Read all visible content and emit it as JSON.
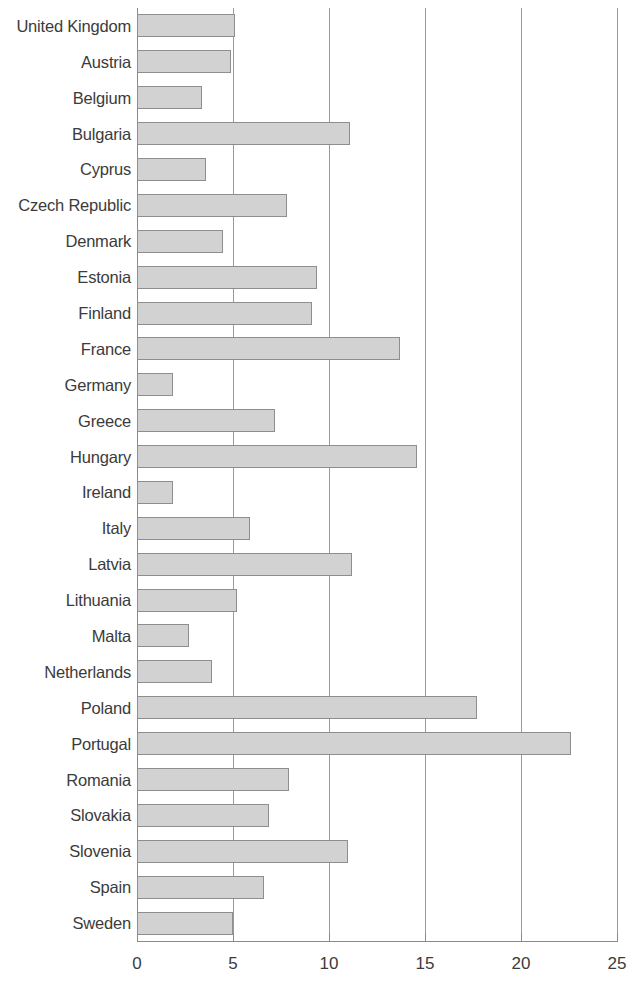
{
  "chart_data": {
    "type": "bar",
    "orientation": "horizontal",
    "title": "",
    "subtitle": "",
    "xlabel": "",
    "ylabel": "",
    "xlim": [
      0,
      25
    ],
    "ylim": null,
    "grid": true,
    "legend": null,
    "xticks": [
      0,
      5,
      10,
      15,
      20,
      25
    ],
    "xtick_labels": [
      "0",
      "5",
      "10",
      "15",
      "20",
      "25"
    ],
    "categories": [
      "United Kingdom",
      "Austria",
      "Belgium",
      "Bulgaria",
      "Cyprus",
      "Czech Republic",
      "Denmark",
      "Estonia",
      "Finland",
      "France",
      "Germany",
      "Greece",
      "Hungary",
      "Ireland",
      "Italy",
      "Latvia",
      "Lithuania",
      "Malta",
      "Netherlands",
      "Poland",
      "Portugal",
      "Romania",
      "Slovakia",
      "Slovenia",
      "Spain",
      "Sweden"
    ],
    "values": [
      5.1,
      4.9,
      3.4,
      11.1,
      3.6,
      7.8,
      4.5,
      9.4,
      9.1,
      13.7,
      1.9,
      7.2,
      14.6,
      1.9,
      5.9,
      11.2,
      5.2,
      2.7,
      3.9,
      17.7,
      22.6,
      7.9,
      6.9,
      11.0,
      6.6,
      5.0
    ],
    "colors": {
      "bar_fill": "#d2d2d2",
      "bar_border": "#8e8e8e",
      "gridline": "#9b9b9b",
      "axis": "#8a8a8a",
      "text": "#3b3b3b",
      "background": "#ffffff"
    }
  }
}
